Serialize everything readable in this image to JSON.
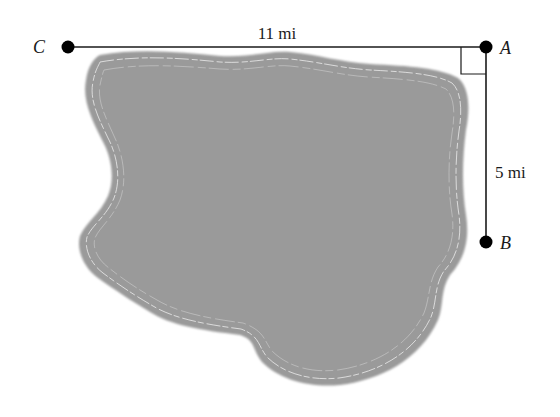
{
  "figure": {
    "colors": {
      "lake_fill": "#9a9a9a",
      "lake_contour": "#e6e6e6",
      "line": "#1a1a1a",
      "point": "#000000",
      "background": "#ffffff"
    },
    "points": [
      {
        "id": "C",
        "label": "C"
      },
      {
        "id": "A",
        "label": "A"
      },
      {
        "id": "B",
        "label": "B"
      }
    ],
    "segments": [
      {
        "from": "C",
        "to": "A",
        "label": "11 mi"
      },
      {
        "from": "A",
        "to": "B",
        "label": "5 mi"
      }
    ],
    "right_angle_at": "A"
  }
}
